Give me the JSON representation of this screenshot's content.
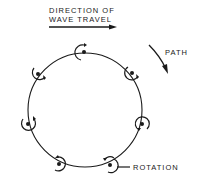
{
  "diagram": {
    "title_line1": "DIRECTION OF",
    "title_line2": "WAVE TRAVEL",
    "path_label": "PATH",
    "rotation_label": "ROTATION",
    "colors": {
      "ink": "#1a1a1a",
      "background": "#ffffff"
    },
    "orbit": {
      "cx": 85,
      "cy": 110,
      "r": 57
    },
    "particles": [
      {
        "x": 84,
        "y": 52
      },
      {
        "x": 132,
        "y": 73
      },
      {
        "x": 142,
        "y": 124
      },
      {
        "x": 110,
        "y": 165
      },
      {
        "x": 59,
        "y": 164
      },
      {
        "x": 28,
        "y": 124
      },
      {
        "x": 38,
        "y": 74
      }
    ]
  }
}
